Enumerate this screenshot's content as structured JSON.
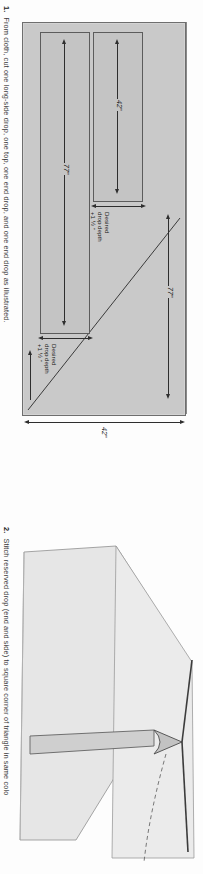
{
  "page": {
    "background": "#fdfdfd",
    "orientation": "rotated-90-ccw"
  },
  "figures": [
    {
      "number": "1.",
      "caption": "From cloth, cut one long-side drop, one top, one end drop, and one end drop as illustrated.",
      "type": "cutting-layout-diagram",
      "fabric_color": "#c9c9c9",
      "pieces": [
        {
          "name": "long-side-drop",
          "length_label": "77\"",
          "width_label_line1": "Desired",
          "width_label_line2": "drop depth",
          "width_label_line3": "+1 ½ \""
        },
        {
          "name": "end-drop",
          "length_label": "42\"",
          "width_label_line1": "Desired",
          "width_label_line2": "drop depth",
          "width_label_line3": "+1 ½ \""
        }
      ],
      "panel_dimensions": {
        "length_label": "77\"",
        "width_label": "42\""
      }
    },
    {
      "number": "2.",
      "caption": "Stitch reserved drop (end and side) to square corner of triangle in same colo",
      "type": "three-dimensional-corner-sketch",
      "cloth_color": "#e2e2e2",
      "seam_color": "#bdbdbd"
    }
  ],
  "labels": {
    "quote_inch": "\"",
    "desired": "Desired",
    "drop_depth": "drop depth",
    "plus_one_half": "+1 ½ \"",
    "len_77": "77\"",
    "len_42": "42\""
  }
}
